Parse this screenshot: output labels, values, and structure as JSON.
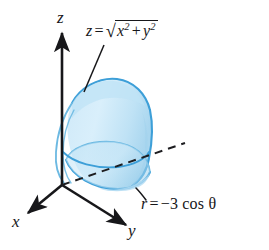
{
  "figure": {
    "name": "solid-region-cone-over-cylinder",
    "background_color": "#ffffff"
  },
  "axes": {
    "x": {
      "label": "x",
      "direction": "down-left",
      "arrowhead": true
    },
    "y": {
      "label": "y",
      "direction": "down-right",
      "arrowhead": true
    },
    "z": {
      "label": "z",
      "direction": "up",
      "arrowhead": true
    },
    "color": "#17171a",
    "origin": {
      "x": 62,
      "y": 185
    }
  },
  "annotations": [
    {
      "id": "cone-equation",
      "parts": {
        "lhs": "z",
        "equals": "=",
        "radical_glyph": "√",
        "base1": "x",
        "exp1": "2",
        "plus": "+",
        "base2": "y",
        "exp2": "2"
      },
      "plain_text": "z = √(x² + y²)",
      "leader_line": "straight",
      "target": "cone-surface"
    },
    {
      "id": "cylinder-equation",
      "parts": {
        "lhs": "r",
        "equals": "=",
        "rhs": "−3 cos θ"
      },
      "plain_text": "r = −3 cos θ",
      "leader_line": "curved",
      "target": "cylinder-base"
    }
  ],
  "surface": {
    "fill_light": "#e3f2fb",
    "fill_mid": "#cbe8f7",
    "fill_deep": "#a9d8f0",
    "outline_color": "#3d9fd8",
    "outline_color_soft": "#6cb9e2",
    "hidden_line_style": "dashed",
    "hidden_line_color": "#1d1d20"
  },
  "colors": {
    "ink": "#17171a",
    "accent_blue": "#3d9fd8",
    "pale_blue": "#d6ecf8"
  }
}
